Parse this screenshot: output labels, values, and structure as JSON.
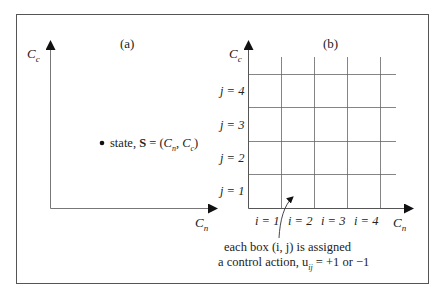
{
  "panel_a": {
    "label": "(a)",
    "y_axis": "C",
    "y_axis_sub": "c",
    "x_axis": "C",
    "x_axis_sub": "n",
    "state_text": "state, ",
    "state_bold": "S",
    "state_eq": " = (",
    "state_cn": "C",
    "state_cn_sub": "n",
    "state_sep": ", ",
    "state_cc": "C",
    "state_cc_sub": "c",
    "state_close": ")"
  },
  "panel_b": {
    "label": "(b)",
    "y_axis": "C",
    "y_axis_sub": "c",
    "x_axis": "C",
    "x_axis_sub": "n",
    "rows": [
      "j = 4",
      "j = 3",
      "j = 2",
      "j = 1"
    ],
    "cols": [
      "i = 1",
      "i = 2",
      "i = 3",
      "i = 4"
    ],
    "annotation_line1": "each box (i, j) is assigned",
    "annotation_line2": "a control action, u",
    "annotation_sub": "ij",
    "annotation_tail": " = +1 or −1"
  }
}
